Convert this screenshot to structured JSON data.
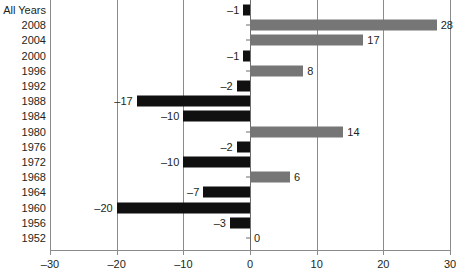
{
  "chart_data": {
    "type": "bar",
    "orientation": "horizontal",
    "title": "",
    "subtitle": "",
    "xlabel": "",
    "ylabel": "",
    "xlim": [
      -30,
      30
    ],
    "xticks": [
      -30,
      -20,
      -10,
      0,
      10,
      20,
      30
    ],
    "xtick_labels": [
      "–30",
      "–20",
      "–10",
      "0",
      "10",
      "20",
      "30"
    ],
    "grid": true,
    "grid_axis": "x",
    "legend": "none",
    "categories": [
      "All Years",
      "2008",
      "2004",
      "2000",
      "1996",
      "1992",
      "1988",
      "1984",
      "1980",
      "1976",
      "1972",
      "1968",
      "1964",
      "1960",
      "1956",
      "1952"
    ],
    "values": [
      -1,
      28,
      17,
      -1,
      8,
      -2,
      -17,
      -10,
      14,
      -2,
      -10,
      6,
      -7,
      -20,
      -3,
      0
    ],
    "value_labels": [
      "–1",
      "28",
      "17",
      "–1",
      "8",
      "–2",
      "–17",
      "–10",
      "14",
      "–2",
      "–10",
      "6",
      "–7",
      "–20",
      "–3",
      "0"
    ],
    "colors": {
      "positive": "#767676",
      "negative": "#101010",
      "axis": "#8b8b8b",
      "text": "#231f20",
      "background": "#ffffff"
    }
  }
}
